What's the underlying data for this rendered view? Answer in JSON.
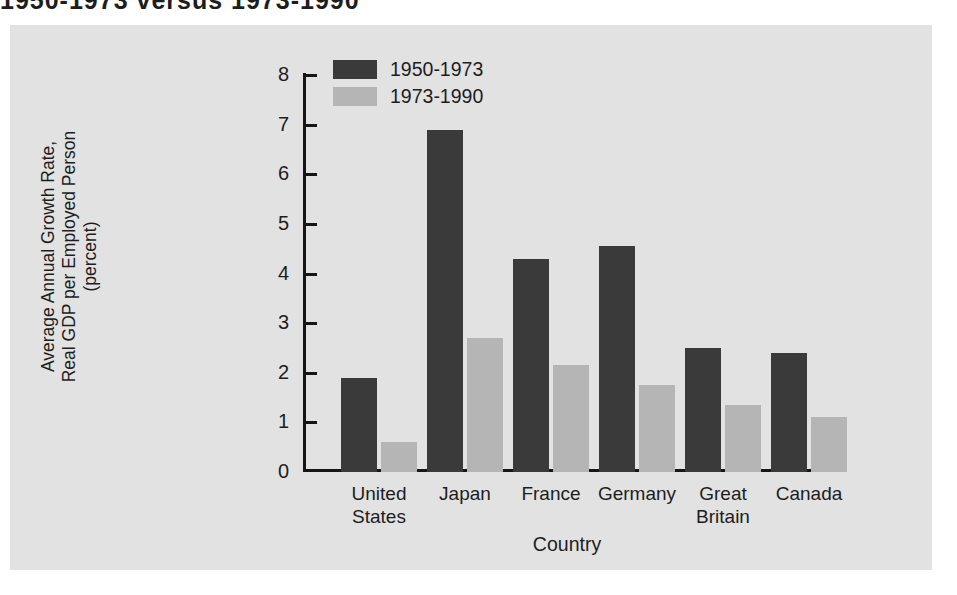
{
  "figure": {
    "title": "1950-1973 versus 1973-1990",
    "panel_bg": "#e2e2e2",
    "page_bg": "#ffffff"
  },
  "chart_data": {
    "type": "bar",
    "title": "1950-1973 versus 1973-1990",
    "xlabel": "Country",
    "ylabel": "Average Annual Growth Rate,\nReal GDP per Employed Person\n(percent)",
    "ylabel_lines": [
      "Average Annual Growth Rate,",
      "Real GDP per Employed Person",
      "(percent)"
    ],
    "categories": [
      "United States",
      "Japan",
      "France",
      "Germany",
      "Great Britain",
      "Canada"
    ],
    "category_lines": [
      [
        "United",
        "States"
      ],
      [
        "Japan",
        ""
      ],
      [
        "France",
        ""
      ],
      [
        "Germany",
        ""
      ],
      [
        "Great",
        "Britain"
      ],
      [
        "Canada",
        ""
      ]
    ],
    "series": [
      {
        "name": "1950-1973",
        "color": "#3a3a3a",
        "values": [
          1.9,
          6.9,
          4.3,
          4.55,
          2.5,
          2.4
        ]
      },
      {
        "name": "1973-1990",
        "color": "#b5b5b5",
        "values": [
          0.6,
          2.7,
          2.15,
          1.75,
          1.35,
          1.1
        ]
      }
    ],
    "ylim": [
      0,
      8
    ],
    "yticks": [
      0,
      1,
      2,
      3,
      4,
      5,
      6,
      7,
      8
    ],
    "ytick_labels": [
      "0",
      "1",
      "2",
      "3",
      "4",
      "5",
      "6",
      "7",
      "8"
    ],
    "grid": false,
    "legend_position": "top-left-inside",
    "axis_color": "#161616"
  }
}
